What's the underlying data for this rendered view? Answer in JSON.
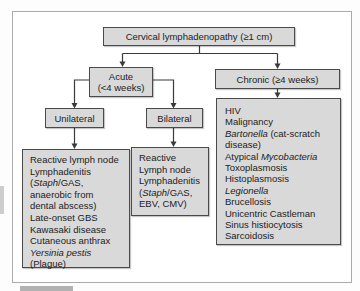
{
  "figure": {
    "root": {
      "label": "Cervical lymphadenopathy (≥1 cm)"
    },
    "acute": {
      "line1": "Acute",
      "line2": "(<4 weeks)"
    },
    "chronic": {
      "label": "Chronic (≥4 weeks)"
    },
    "unilateral": {
      "label": "Unilateral"
    },
    "bilateral": {
      "label": "Bilateral"
    },
    "unilateral_causes": {
      "lines": [
        [
          {
            "t": "Reactive lymph node"
          }
        ],
        [
          {
            "t": "Lymphadenitis"
          }
        ],
        [
          {
            "t": "("
          },
          {
            "t": "Staph",
            "i": true
          },
          {
            "t": "/GAS,"
          }
        ],
        [
          {
            "t": "anaerobic from"
          }
        ],
        [
          {
            "t": "dental abscess)"
          }
        ],
        [
          {
            "t": "Late-onset GBS"
          }
        ],
        [
          {
            "t": "Kawasaki disease"
          }
        ],
        [
          {
            "t": "Cutaneous anthrax"
          }
        ],
        [
          {
            "t": "Yersinia pestis",
            "i": true
          }
        ],
        [
          {
            "t": "(Plague)"
          }
        ]
      ]
    },
    "bilateral_causes": {
      "lines": [
        [
          {
            "t": "Reactive"
          }
        ],
        [
          {
            "t": "Lymph node"
          }
        ],
        [
          {
            "t": "Lymphadenitis"
          }
        ],
        [
          {
            "t": "("
          },
          {
            "t": "Staph",
            "i": true
          },
          {
            "t": "/GAS,"
          }
        ],
        [
          {
            "t": "EBV, CMV)"
          }
        ]
      ]
    },
    "chronic_causes": {
      "lines": [
        [
          {
            "t": "HIV"
          }
        ],
        [
          {
            "t": "Malignancy"
          }
        ],
        [
          {
            "t": "Bartonella",
            "i": true
          },
          {
            "t": " (cat-scratch"
          }
        ],
        [
          {
            "t": "disease)"
          }
        ],
        [
          {
            "t": "Atypical "
          },
          {
            "t": "Mycobacteria",
            "i": true
          }
        ],
        [
          {
            "t": "Toxoplasmosis"
          }
        ],
        [
          {
            "t": "Histoplasmosis"
          }
        ],
        [
          {
            "t": "Legionella",
            "i": true
          }
        ],
        [
          {
            "t": "Brucellosis"
          }
        ],
        [
          {
            "t": "Unicentric Castleman"
          }
        ],
        [
          {
            "t": "Sinus histiocytosis"
          }
        ],
        [
          {
            "t": "Sarcoidosis"
          }
        ]
      ]
    }
  },
  "colors": {
    "box_fill": "#d9d9d9",
    "box_border": "#4a4a4a",
    "connector": "#3a3a3a",
    "frame_border": "#ababab"
  }
}
